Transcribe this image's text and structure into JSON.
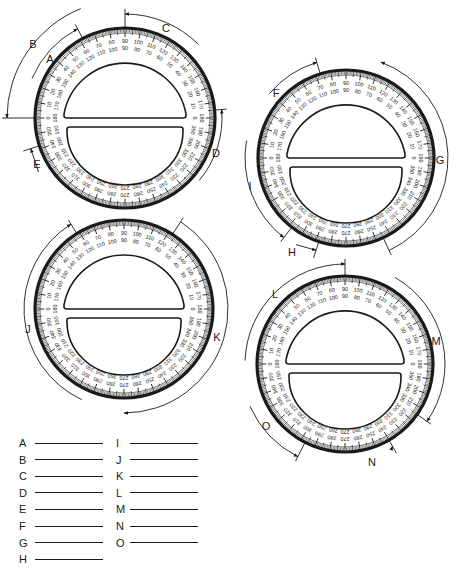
{
  "worksheet": {
    "title": "Reading a 360 degree protractor",
    "ink_color": "#1a1a1a",
    "paper_color": "#ffffff"
  },
  "protractors": [
    {
      "id": "p1",
      "center": [
        125,
        118
      ],
      "radius": 90,
      "rotation": 0,
      "arcs": [
        {
          "label": "A",
          "label_pos": [
            50,
            60
          ],
          "from_deg": 157,
          "to_deg": 118,
          "arc_r": 101,
          "arrow": "end"
        },
        {
          "label": "B",
          "label_pos": [
            33,
            45
          ],
          "from_deg": 112,
          "to_deg": 180,
          "arc_r": 118,
          "arrow": "end"
        },
        {
          "label": "C",
          "label_pos": [
            166,
            29
          ],
          "from_deg": 45,
          "to_deg": 90,
          "arc_r": 104,
          "arrow": "end"
        },
        {
          "label": "D",
          "label_pos": [
            216,
            154
          ],
          "from_deg": 320,
          "to_deg": 5,
          "arc_r": 97,
          "arrow": "end"
        },
        {
          "label": "E",
          "label_pos": [
            37,
            165
          ],
          "from_deg": 212,
          "to_deg": 198,
          "arc_r": 102,
          "arrow": "end",
          "small": true
        }
      ]
    },
    {
      "id": "p2",
      "center": [
        346,
        158
      ],
      "radius": 88,
      "rotation": 0,
      "arcs": [
        {
          "label": "F",
          "label_pos": [
            276,
            94
          ],
          "from_deg": 140,
          "to_deg": 107,
          "arc_r": 100,
          "arrow": "end"
        },
        {
          "label": "G",
          "label_pos": [
            440,
            161
          ],
          "from_deg": 70,
          "to_deg": 295,
          "arc_r": 102,
          "arrow": "start",
          "long_cw": true
        },
        {
          "label": "H",
          "label_pos": [
            292,
            253
          ],
          "from_deg": 240,
          "to_deg": 252,
          "arc_r": 100,
          "arrow": "end",
          "small": true
        },
        {
          "label": "I",
          "label_pos": [
            250,
            187
          ],
          "from_deg": 170,
          "to_deg": 232,
          "arc_r": 101,
          "arrow": "end"
        }
      ]
    },
    {
      "id": "p3",
      "center": [
        124,
        309
      ],
      "radius": 89,
      "rotation": 0,
      "arcs": [
        {
          "label": "J",
          "label_pos": [
            28,
            330
          ],
          "from_deg": 245,
          "to_deg": 122,
          "arc_r": 100,
          "arrow": "end",
          "long_cw": true
        },
        {
          "label": "K",
          "label_pos": [
            217,
            338
          ],
          "from_deg": 270,
          "to_deg": 57,
          "arc_r": 104,
          "arrow": "start",
          "ccw": true
        }
      ]
    },
    {
      "id": "p4",
      "center": [
        345,
        364
      ],
      "radius": 88,
      "rotation": 0,
      "arcs": [
        {
          "label": "L",
          "label_pos": [
            275,
            295
          ],
          "from_deg": 178,
          "to_deg": 90,
          "arc_r": 100,
          "arrow": "end",
          "cw_short": true
        },
        {
          "label": "M",
          "label_pos": [
            436,
            342
          ],
          "from_deg": 60,
          "to_deg": 325,
          "arc_r": 100,
          "arrow": "end",
          "cw_short": true
        },
        {
          "label": "N",
          "label_pos": [
            372,
            463
          ],
          "from_deg": 298,
          "to_deg": 300,
          "arc_r": 98,
          "arrow": "end",
          "small": true
        },
        {
          "label": "O",
          "label_pos": [
            266,
            427
          ],
          "from_deg": 204,
          "to_deg": 243,
          "arc_r": 104,
          "arrow": "end"
        }
      ]
    }
  ],
  "scale": {
    "outer_labels_upper": [
      "0",
      "10",
      "20",
      "30",
      "40",
      "50",
      "60",
      "70",
      "80",
      "90",
      "100",
      "110",
      "120",
      "130",
      "140",
      "150",
      "160",
      "170",
      "180"
    ],
    "inner_labels_upper": [
      "180",
      "170",
      "160",
      "150",
      "140",
      "130",
      "120",
      "110",
      "100",
      "90",
      "80",
      "70",
      "60",
      "50",
      "40",
      "30",
      "20",
      "10",
      "0"
    ],
    "outer_labels_lower": [
      "360",
      "350",
      "340",
      "330",
      "320",
      "310",
      "300",
      "290",
      "280",
      "270",
      "260",
      "250",
      "240",
      "230",
      "220",
      "210",
      "200",
      "190",
      "180"
    ],
    "inner_labels_lower": [
      "180",
      "190",
      "200",
      "210",
      "220",
      "230",
      "240",
      "250",
      "260",
      "270",
      "280",
      "290",
      "300",
      "310",
      "320",
      "330",
      "340",
      "350",
      "360"
    ]
  },
  "answers": {
    "left": [
      {
        "letter": "A",
        "value": ""
      },
      {
        "letter": "B",
        "value": ""
      },
      {
        "letter": "C",
        "value": ""
      },
      {
        "letter": "D",
        "value": ""
      },
      {
        "letter": "E",
        "value": ""
      },
      {
        "letter": "F",
        "value": ""
      },
      {
        "letter": "G",
        "value": ""
      },
      {
        "letter": "H",
        "value": ""
      }
    ],
    "right": [
      {
        "letter": "I",
        "value": ""
      },
      {
        "letter": "J",
        "value": ""
      },
      {
        "letter": "K",
        "value": ""
      },
      {
        "letter": "L",
        "value": ""
      },
      {
        "letter": "M",
        "value": ""
      },
      {
        "letter": "N",
        "value": ""
      },
      {
        "letter": "O",
        "value": ""
      }
    ]
  }
}
